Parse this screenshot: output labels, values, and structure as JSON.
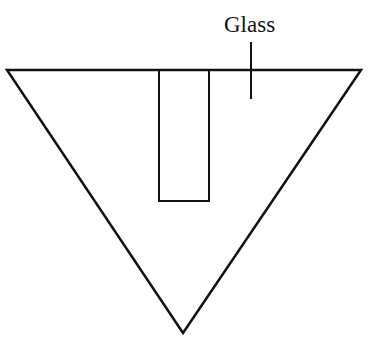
{
  "diagram": {
    "title": "",
    "label": "Glass",
    "colors": {
      "stroke": "#111111",
      "background": "#ffffff"
    },
    "shapes": {
      "triangle": {
        "points": [
          [
            7,
            70
          ],
          [
            361,
            70
          ],
          [
            183,
            333
          ]
        ]
      },
      "rectangle": {
        "x": 159,
        "y": 70,
        "width": 50,
        "height": 131
      },
      "leader_line": {
        "x": 251,
        "y1": 42,
        "y2": 99
      }
    }
  }
}
